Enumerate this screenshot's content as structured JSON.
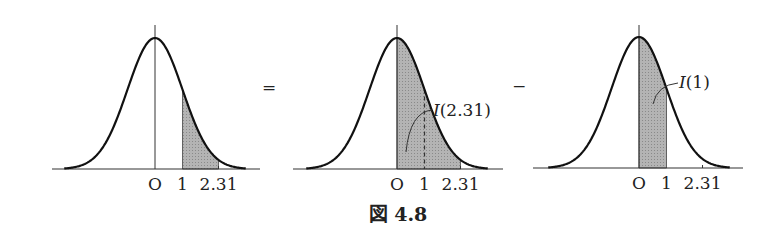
{
  "figure": {
    "caption": "図 4.8",
    "operators": {
      "equals": "=",
      "minus": "−"
    },
    "panels": [
      {
        "id": "left",
        "tick_labels": [
          "O",
          "1",
          "2.31"
        ],
        "shaded_from": 1,
        "shaded_to": 2.31,
        "annotation": ""
      },
      {
        "id": "middle",
        "tick_labels": [
          "O",
          "1",
          "2.31"
        ],
        "shaded_from": 0,
        "shaded_to": 2.31,
        "dashed_at": 1,
        "annotation": "I(2.31)"
      },
      {
        "id": "right",
        "tick_labels": [
          "O",
          "1",
          "2.31"
        ],
        "shaded_from": 0,
        "shaded_to": 1,
        "annotation": "I(1)"
      }
    ],
    "colors": {
      "curve": "#111111",
      "shade": "#a8a8a8",
      "axis": "#333333"
    }
  },
  "chart_data": {
    "type": "area",
    "title": "図 4.8",
    "xlabel": "",
    "ylabel": "",
    "x_ticks": [
      "O",
      "1",
      "2.31"
    ],
    "series": [
      {
        "name": "P(1 ≤ Z ≤ 2.31)",
        "shaded_range": [
          1,
          2.31
        ]
      },
      {
        "name": "I(2.31)",
        "shaded_range": [
          0,
          2.31
        ]
      },
      {
        "name": "I(1)",
        "shaded_range": [
          0,
          1
        ]
      }
    ]
  }
}
